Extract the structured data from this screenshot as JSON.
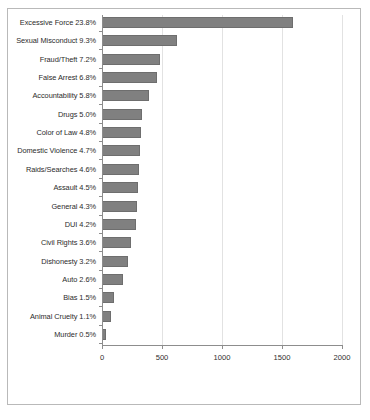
{
  "chart_data": {
    "type": "bar",
    "orientation": "horizontal",
    "title": "",
    "xlabel": "",
    "ylabel": "",
    "xlim": [
      0,
      2000
    ],
    "xticks": [
      0,
      500,
      1000,
      1500,
      2000
    ],
    "grid": true,
    "legend": false,
    "bar_color": "#808080",
    "categories": [
      "Excessive Force 23.8%",
      "Sexual Misconduct 9.3%",
      "Fraud/Theft 7.2%",
      "False Arrest 6.8%",
      "Accountability 5.8%",
      "Drugs 5.0%",
      "Color of Law 4.8%",
      "Domestic Violence 4.7%",
      "Raids/Searches 4.6%",
      "Assault 4.5%",
      "General 4.3%",
      "DUI 4.2%",
      "Civil Rights 3.6%",
      "Dishonesty 3.2%",
      "Auto 2.6%",
      "Bias 1.5%",
      "Animal Cruelty 1.1%",
      "Murder 0.5%"
    ],
    "percentages": [
      23.8,
      9.3,
      7.2,
      6.8,
      5.8,
      5.0,
      4.8,
      4.7,
      4.6,
      4.5,
      4.3,
      4.2,
      3.6,
      3.2,
      2.6,
      1.5,
      1.1,
      0.5
    ],
    "values": [
      1592,
      622,
      482,
      455,
      388,
      335,
      321,
      314,
      308,
      301,
      288,
      281,
      241,
      214,
      174,
      100,
      74,
      33
    ]
  }
}
